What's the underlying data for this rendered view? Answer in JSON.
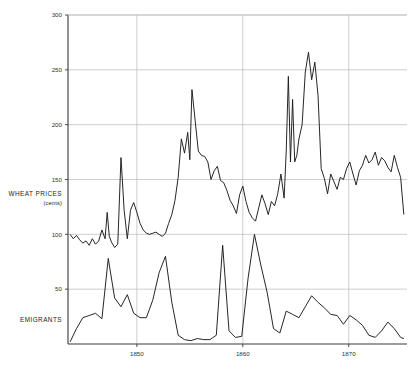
{
  "chart_data": {
    "type": "line",
    "title": "",
    "subtitle": "",
    "xlabel": "",
    "ylabel": "WHEAT PRICES (cents)",
    "grid": true,
    "legend_position": "inline-left",
    "xlim": [
      1843.5,
      1875.5
    ],
    "ylim": [
      0,
      300
    ],
    "x_ticks": [
      1850,
      1860,
      1870
    ],
    "x_tick_labels": [
      "1850",
      "1860",
      "1870"
    ],
    "y_ticks": [
      50,
      100,
      150,
      200,
      250,
      300
    ],
    "y_tick_labels": [
      "50",
      "100",
      "150",
      "200",
      "250",
      "300"
    ],
    "annotations": [
      {
        "text": "WHEAT PRICES",
        "role": "series-label",
        "series": "wheat_prices"
      },
      {
        "text": "(cents)",
        "role": "series-sublabel",
        "series": "wheat_prices"
      },
      {
        "text": "EMIGRANTS",
        "role": "series-label",
        "series": "emigrants"
      }
    ],
    "series": [
      {
        "name": "WHEAT PRICES",
        "units": "cents",
        "color": "#1a1a1a",
        "x": [
          1843.7,
          1844.0,
          1844.3,
          1844.6,
          1844.9,
          1845.2,
          1845.5,
          1845.8,
          1846.1,
          1846.4,
          1846.7,
          1847.0,
          1847.2,
          1847.4,
          1847.6,
          1847.9,
          1848.2,
          1848.5,
          1848.8,
          1849.1,
          1849.4,
          1849.7,
          1850.0,
          1850.3,
          1850.6,
          1850.9,
          1851.2,
          1851.5,
          1851.8,
          1852.1,
          1852.4,
          1852.7,
          1853.0,
          1853.3,
          1853.6,
          1853.9,
          1854.2,
          1854.5,
          1854.8,
          1855.0,
          1855.2,
          1855.5,
          1855.8,
          1856.1,
          1856.4,
          1856.7,
          1857.0,
          1857.3,
          1857.6,
          1857.9,
          1858.2,
          1858.5,
          1858.8,
          1859.1,
          1859.4,
          1859.7,
          1860.0,
          1860.3,
          1860.6,
          1860.9,
          1861.2,
          1861.5,
          1861.8,
          1862.1,
          1862.4,
          1862.7,
          1863.0,
          1863.3,
          1863.6,
          1863.9,
          1864.1,
          1864.3,
          1864.5,
          1864.7,
          1864.9,
          1865.1,
          1865.3,
          1865.6,
          1865.9,
          1866.2,
          1866.5,
          1866.8,
          1867.1,
          1867.4,
          1867.7,
          1868.0,
          1868.3,
          1868.6,
          1868.9,
          1869.2,
          1869.5,
          1869.8,
          1870.1,
          1870.4,
          1870.7,
          1871.0,
          1871.3,
          1871.6,
          1871.9,
          1872.2,
          1872.5,
          1872.8,
          1873.1,
          1873.4,
          1873.7,
          1874.0,
          1874.3,
          1874.6,
          1874.9,
          1875.2
        ],
        "values": [
          100,
          96,
          99,
          95,
          92,
          94,
          90,
          96,
          91,
          94,
          104,
          96,
          120,
          98,
          93,
          88,
          91,
          170,
          122,
          96,
          122,
          129,
          120,
          110,
          104,
          101,
          100,
          101,
          102,
          100,
          98,
          101,
          110,
          118,
          131,
          152,
          187,
          174,
          193,
          168,
          232,
          204,
          176,
          172,
          171,
          166,
          150,
          158,
          162,
          149,
          147,
          140,
          131,
          126,
          119,
          136,
          144,
          130,
          120,
          115,
          112,
          124,
          136,
          128,
          118,
          130,
          126,
          137,
          155,
          133,
          176,
          244,
          166,
          223,
          166,
          172,
          187,
          200,
          248,
          266,
          241,
          257,
          227,
          160,
          151,
          137,
          155,
          148,
          141,
          152,
          150,
          160,
          166,
          155,
          145,
          158,
          163,
          172,
          165,
          168,
          175,
          163,
          170,
          167,
          161,
          157,
          172,
          161,
          152,
          118
        ]
      },
      {
        "name": "EMIGRANTS",
        "units": "thousands",
        "color": "#1a1a1a",
        "x": [
          1843.7,
          1844.3,
          1844.9,
          1845.5,
          1846.1,
          1846.7,
          1847.3,
          1847.9,
          1848.5,
          1849.1,
          1849.7,
          1850.3,
          1850.9,
          1851.5,
          1852.1,
          1852.7,
          1853.3,
          1853.9,
          1854.5,
          1855.1,
          1855.7,
          1856.3,
          1856.9,
          1857.5,
          1858.1,
          1858.7,
          1859.3,
          1859.9,
          1860.5,
          1861.1,
          1861.7,
          1862.3,
          1862.9,
          1863.5,
          1864.1,
          1864.7,
          1865.3,
          1865.9,
          1866.5,
          1867.1,
          1867.7,
          1868.3,
          1868.9,
          1869.5,
          1870.1,
          1870.7,
          1871.3,
          1871.9,
          1872.5,
          1873.1,
          1873.7,
          1874.3,
          1874.9,
          1875.2
        ],
        "values": [
          2,
          14,
          24,
          26,
          28,
          23,
          78,
          42,
          34,
          45,
          28,
          24,
          24,
          40,
          65,
          80,
          38,
          8,
          4,
          3,
          5,
          4,
          4,
          8,
          90,
          12,
          6,
          7,
          60,
          100,
          72,
          47,
          14,
          10,
          30,
          27,
          24,
          34,
          44,
          38,
          33,
          27,
          26,
          18,
          26,
          22,
          17,
          8,
          6,
          12,
          20,
          14,
          6,
          5
        ]
      }
    ]
  },
  "labels": {
    "wheat_title": "WHEAT PRICES",
    "wheat_units": "(cents)",
    "emigrants_title": "EMIGRANTS"
  }
}
